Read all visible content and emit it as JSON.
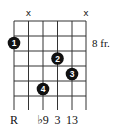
{
  "chord_diagram": {
    "type": "guitar-chord-chart",
    "colors": {
      "background": "#ffffff",
      "grid": "#333333",
      "dot": "#111111",
      "dot_text": "#ffffff",
      "text": "#111111"
    },
    "fret_position_label": "8 fr.",
    "strings_count": 6,
    "frets_shown": 5,
    "muted_strings": [
      {
        "string": 2,
        "symbol": "x"
      },
      {
        "string": 6,
        "symbol": "x"
      }
    ],
    "fingers": [
      {
        "finger": "1",
        "string": 1,
        "fret_row": 2
      },
      {
        "finger": "2",
        "string": 4,
        "fret_row": 3
      },
      {
        "finger": "3",
        "string": 5,
        "fret_row": 4
      },
      {
        "finger": "4",
        "string": 3,
        "fret_row": 5
      }
    ],
    "interval_labels": [
      {
        "string": 1,
        "text": "R"
      },
      {
        "string": 3,
        "text": "♭9"
      },
      {
        "string": 4,
        "text": "3"
      },
      {
        "string": 5,
        "text": "13"
      }
    ]
  }
}
